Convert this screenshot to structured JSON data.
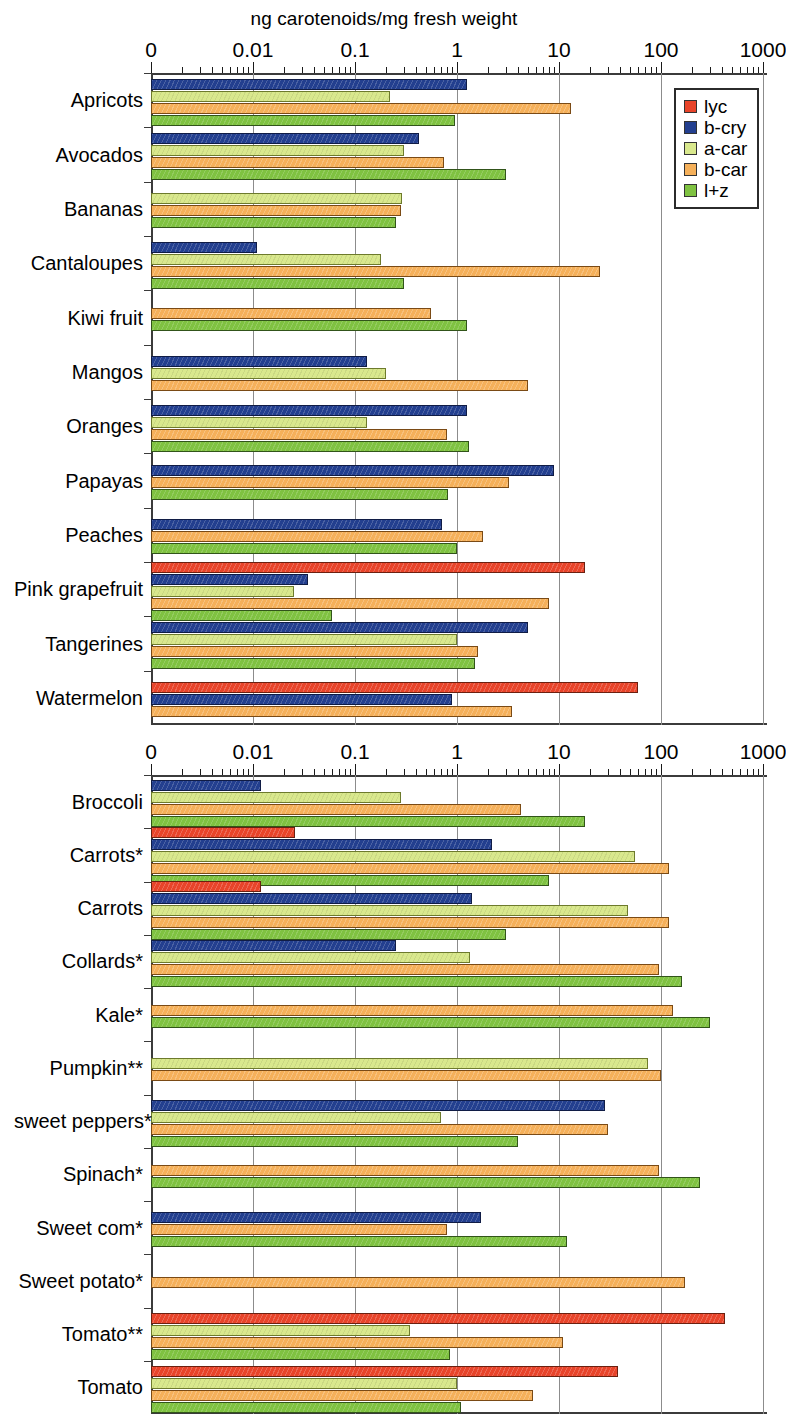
{
  "figure": {
    "title": "ng carotenoids/mg fresh weight"
  },
  "legend": {
    "position": "top-right-of-panel-1",
    "items": [
      {
        "key": "lyc",
        "label": "lyc",
        "color": "#e8442a"
      },
      {
        "key": "bcry",
        "label": "b-cry",
        "color": "#233f8f"
      },
      {
        "key": "acar",
        "label": "a-car",
        "color": "#d9e88d"
      },
      {
        "key": "bcar",
        "label": "b-car",
        "color": "#f5b05a"
      },
      {
        "key": "lz",
        "label": "l+z",
        "color": "#7fc241"
      }
    ]
  },
  "axis": {
    "tick_labels": [
      "0",
      "0.01",
      "0.1",
      "1",
      "10",
      "100",
      "1000"
    ],
    "scale": "log",
    "decades": [
      -3,
      -2,
      -1,
      0,
      1,
      2,
      3
    ],
    "xmin_label": "0",
    "xmax_label": "1000"
  },
  "chart_data": [
    {
      "type": "bar",
      "orientation": "horizontal",
      "panel": 1,
      "title": "ng carotenoids/mg fresh weight",
      "xlabel": "ng carotenoids/mg fresh weight",
      "ylabel": "",
      "xscale": "log",
      "xlim": [
        0.001,
        1000
      ],
      "xticks": [
        0.001,
        0.01,
        0.1,
        1,
        10,
        100,
        1000
      ],
      "xticklabels": [
        "0",
        "0.01",
        "0.1",
        "1",
        "10",
        "100",
        "1000"
      ],
      "grid": true,
      "legend": [
        "lyc",
        "b-cry",
        "a-car",
        "b-car",
        "l+z"
      ],
      "categories": [
        "Apricots",
        "Avocados",
        "Bananas",
        "Cantaloupes",
        "Kiwi fruit",
        "Mangos",
        "Oranges",
        "Papayas",
        "Peaches",
        "Pink grapefruit",
        "Tangerines",
        "Watermelon"
      ],
      "series": [
        {
          "name": "lyc",
          "values": [
            null,
            null,
            null,
            null,
            null,
            null,
            null,
            null,
            null,
            18,
            null,
            60
          ]
        },
        {
          "name": "b-cry",
          "values": [
            1.25,
            0.42,
            null,
            0.011,
            null,
            0.13,
            1.25,
            9.0,
            0.72,
            0.035,
            5.0,
            0.9
          ]
        },
        {
          "name": "a-car",
          "values": [
            0.22,
            0.3,
            0.29,
            0.18,
            null,
            0.2,
            0.13,
            null,
            null,
            0.025,
            1.0,
            null
          ]
        },
        {
          "name": "b-car",
          "values": [
            13,
            0.75,
            0.28,
            25,
            0.55,
            5.0,
            0.8,
            3.2,
            1.8,
            8.0,
            1.6,
            3.5
          ]
        },
        {
          "name": "l+z",
          "values": [
            0.95,
            3.0,
            0.25,
            0.3,
            1.25,
            null,
            1.3,
            0.82,
            1.0,
            0.06,
            1.5,
            null
          ]
        }
      ]
    },
    {
      "type": "bar",
      "orientation": "horizontal",
      "panel": 2,
      "title": "",
      "xlabel": "ng carotenoids/mg fresh weight",
      "ylabel": "",
      "xscale": "log",
      "xlim": [
        0.001,
        1000
      ],
      "xticks": [
        0.001,
        0.01,
        0.1,
        1,
        10,
        100,
        1000
      ],
      "xticklabels": [
        "0",
        "0.01",
        "0.1",
        "1",
        "10",
        "100",
        "1000"
      ],
      "grid": true,
      "legend": [
        "lyc",
        "b-cry",
        "a-car",
        "b-car",
        "l+z"
      ],
      "categories": [
        "Broccoli",
        "Carrots*",
        "Carrots",
        "Collards*",
        "Kale*",
        "Pumpkin**",
        "sweet peppers*",
        "Spinach*",
        "Sweet com*",
        "Sweet potato*",
        "Tomato**",
        "Tomato"
      ],
      "series": [
        {
          "name": "lyc",
          "values": [
            null,
            0.026,
            0.012,
            null,
            null,
            null,
            null,
            null,
            null,
            null,
            420,
            38
          ]
        },
        {
          "name": "b-cry",
          "values": [
            0.012,
            2.2,
            1.4,
            0.25,
            null,
            null,
            28,
            null,
            1.7,
            null,
            null,
            null
          ]
        },
        {
          "name": "a-car",
          "values": [
            0.28,
            55,
            48,
            1.35,
            null,
            75,
            0.7,
            null,
            null,
            null,
            0.35,
            1.0
          ]
        },
        {
          "name": "b-car",
          "values": [
            4.2,
            120,
            120,
            95,
            130,
            100,
            30,
            95,
            0.8,
            170,
            11,
            5.5
          ]
        },
        {
          "name": "l+z",
          "values": [
            18,
            8.0,
            3.0,
            160,
            300,
            null,
            4.0,
            240,
            12,
            null,
            0.85,
            1.1
          ]
        }
      ]
    }
  ],
  "footnotes": {
    "single_star": "*",
    "double_star": "**"
  }
}
